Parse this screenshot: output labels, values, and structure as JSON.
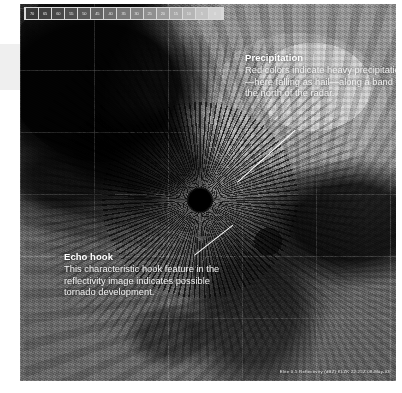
{
  "figure": {
    "kind": "weather-radar-reflectivity-image",
    "background_color": "#6f6f6f",
    "annotation_color": "#ffffff"
  },
  "colorbar": {
    "name": "reflectivity-dbz-scale",
    "units": "dBZ",
    "labels": [
      "70",
      "65",
      "60",
      "55",
      "50",
      "45",
      "40",
      "35",
      "30",
      "25",
      "20",
      "15",
      "10",
      "5",
      "0"
    ],
    "swatch_colors": [
      "#3a3a3a",
      "#414141",
      "#484848",
      "#505050",
      "#595959",
      "#636363",
      "#6d6d6d",
      "#787878",
      "#838383",
      "#8f8f8f",
      "#9b9b9b",
      "#a8a8a8",
      "#b5b5b5",
      "#c3c3c3",
      "#d2d2d2"
    ]
  },
  "callouts": [
    {
      "id": "precipitation",
      "heading": "Precipitation",
      "body": "Red colors indicate heavy precipitation—here falling as hail—along a band to the north of the radar."
    },
    {
      "id": "echo-hook",
      "heading": "Echo hook",
      "body": "This characteristic hook feature in the reflectivity image indicates possible tornado development."
    }
  ],
  "caption": {
    "text": "Elite 0.5 Reflectivity (dBZ) KLZK 22:25Z 08-May-03"
  }
}
